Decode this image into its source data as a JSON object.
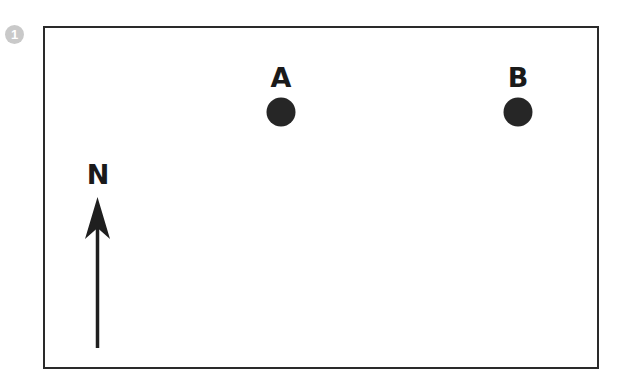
{
  "figure": {
    "badge_number": "1",
    "points": [
      {
        "label": "A",
        "x": 281,
        "y": 112
      },
      {
        "label": "B",
        "x": 518,
        "y": 112
      }
    ],
    "north_arrow": {
      "label": "N"
    },
    "colors": {
      "ink": "#262626",
      "badge": "#c9c9c9",
      "background": "#ffffff"
    }
  }
}
